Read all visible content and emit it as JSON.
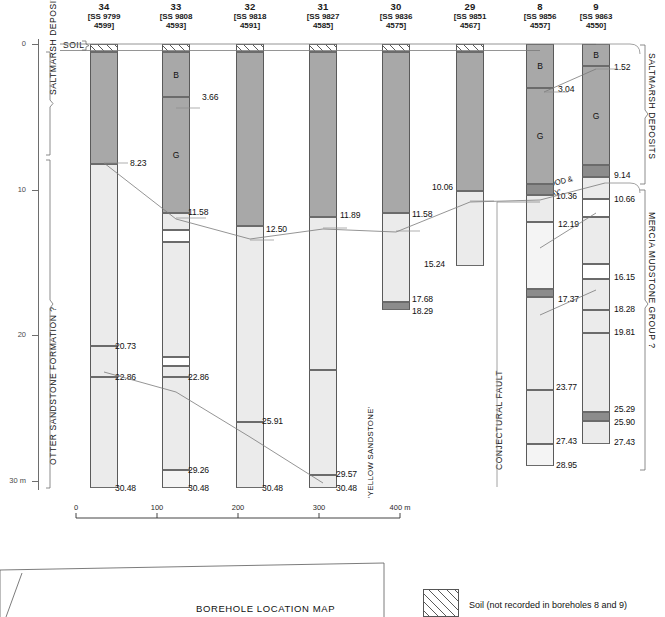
{
  "figure": {
    "soil_label": "SOIL",
    "left_group_labels": [
      "SALTMARSH DEPOSITS",
      "OTTER SANDSTONE FORMATION ?"
    ],
    "right_group_labels": [
      "SALTMARSH DEPOSITS",
      "MERCIA MUDSTONE GROUP ?"
    ],
    "fault_label": "CONJECTURAL FAULT",
    "depth_axis": {
      "ticks": [
        "0",
        "10",
        "20",
        "30 m"
      ],
      "values": [
        0,
        10,
        20,
        30
      ],
      "unit": "m"
    },
    "scale_bar": {
      "ticks": [
        "0",
        "100",
        "200",
        "300",
        "400 m"
      ],
      "values": [
        0,
        100,
        200,
        300,
        400
      ]
    },
    "legend": {
      "soil_swatch_label": "Soil (not recorded in boreholes 8 and 9)",
      "map_title": "BOREHOLE LOCATION MAP"
    },
    "inline_labels": {
      "red_marl_and_stone": "'RED MARL AND STONE'",
      "red_marl_and_stone_2line": "'RED MARL AND STONE'",
      "yellow_sandstone": "'YELLOW SANDSTONE'",
      "wood_and_clay": "'WOOD & CLAY'"
    }
  },
  "chart_data": {
    "type": "table",
    "ylabel": "Depth (m)",
    "ylim": [
      0,
      31
    ],
    "xlabel": "Distance (m)",
    "xlim": [
      0,
      400
    ],
    "boreholes": [
      {
        "id": "34",
        "grid_line1": "[SS 9799",
        "grid_line2": "4599]",
        "total_depth": "30.48",
        "depth_labels": [
          "8.23",
          "20.73",
          "22.86",
          "30.48"
        ],
        "layers": [
          {
            "top": 0.0,
            "base": 0.55,
            "fill": "soil",
            "label": ""
          },
          {
            "top": 0.55,
            "base": 8.23,
            "fill": "dark",
            "label": ""
          },
          {
            "top": 8.23,
            "base": 20.73,
            "fill": "light",
            "label": ""
          },
          {
            "top": 20.73,
            "base": 22.86,
            "fill": "light",
            "label": ""
          },
          {
            "top": 22.86,
            "base": 30.48,
            "fill": "light",
            "label": ""
          }
        ]
      },
      {
        "id": "33",
        "grid_line1": "[SS 9808",
        "grid_line2": "4593]",
        "total_depth": "30.48",
        "depth_labels": [
          "3.66",
          "11.58",
          "22.86",
          "30.48"
        ],
        "layers": [
          {
            "top": 0.0,
            "base": 0.55,
            "fill": "soil",
            "label": ""
          },
          {
            "top": 0.55,
            "base": 3.66,
            "fill": "dark",
            "label": "B"
          },
          {
            "top": 3.66,
            "base": 11.58,
            "fill": "dark",
            "label": "G"
          },
          {
            "top": 11.58,
            "base": 12.8,
            "fill": "light",
            "label": ""
          },
          {
            "top": 12.8,
            "base": 13.6,
            "fill": "white",
            "label": ""
          },
          {
            "top": 13.6,
            "base": 21.5,
            "fill": "light",
            "label": ""
          },
          {
            "top": 21.5,
            "base": 22.1,
            "fill": "white",
            "label": ""
          },
          {
            "top": 22.1,
            "base": 22.86,
            "fill": "light",
            "label": ""
          },
          {
            "top": 22.86,
            "base": 29.26,
            "fill": "light",
            "label": ""
          },
          {
            "top": 29.26,
            "base": 30.48,
            "fill": "lighter",
            "label": ""
          }
        ]
      },
      {
        "id": "32",
        "grid_line1": "[SS 9818",
        "grid_line2": "4591]",
        "total_depth": "30.48",
        "depth_labels": [
          "12.50",
          "25.91",
          "30.48"
        ],
        "layers": [
          {
            "top": 0.0,
            "base": 0.55,
            "fill": "soil",
            "label": ""
          },
          {
            "top": 0.55,
            "base": 12.5,
            "fill": "dark",
            "label": ""
          },
          {
            "top": 12.5,
            "base": 25.91,
            "fill": "light",
            "label": ""
          },
          {
            "top": 25.91,
            "base": 30.48,
            "fill": "light",
            "label": ""
          }
        ]
      },
      {
        "id": "31",
        "grid_line1": "[SS 9827",
        "grid_line2": "4585]",
        "total_depth": "30.48",
        "depth_labels": [
          "11.89",
          "29.57",
          "30.48"
        ],
        "layers": [
          {
            "top": 0.0,
            "base": 0.55,
            "fill": "soil",
            "label": ""
          },
          {
            "top": 0.55,
            "base": 11.89,
            "fill": "dark",
            "label": ""
          },
          {
            "top": 11.89,
            "base": 22.4,
            "fill": "light",
            "label": ""
          },
          {
            "top": 22.4,
            "base": 29.57,
            "fill": "light",
            "label": ""
          },
          {
            "top": 29.57,
            "base": 30.48,
            "fill": "light",
            "label": ""
          }
        ]
      },
      {
        "id": "30",
        "grid_line1": "[SS 9836",
        "grid_line2": "4575]",
        "total_depth": "18.29",
        "depth_labels": [
          "11.58",
          "17.68",
          "18.29"
        ],
        "layers": [
          {
            "top": 0.0,
            "base": 0.55,
            "fill": "soil",
            "label": ""
          },
          {
            "top": 0.55,
            "base": 11.58,
            "fill": "dark",
            "label": ""
          },
          {
            "top": 11.58,
            "base": 17.68,
            "fill": "light",
            "label": ""
          },
          {
            "top": 17.68,
            "base": 18.29,
            "fill": "darker",
            "label": ""
          }
        ]
      },
      {
        "id": "29",
        "grid_line1": "[SS 9851",
        "grid_line2": "4567]",
        "total_depth": "15.24",
        "depth_labels": [
          "10.06",
          "15.24"
        ],
        "layers": [
          {
            "top": 0.0,
            "base": 0.55,
            "fill": "soil",
            "label": ""
          },
          {
            "top": 0.55,
            "base": 10.06,
            "fill": "dark",
            "label": ""
          },
          {
            "top": 10.06,
            "base": 15.24,
            "fill": "light",
            "label": ""
          }
        ]
      },
      {
        "id": "8",
        "grid_line1": "[SS 9856",
        "grid_line2": "4557]",
        "total_depth": "28.95",
        "depth_labels": [
          "3.04",
          "10.36",
          "12.19",
          "17.37",
          "23.77",
          "27.43",
          "28.95"
        ],
        "layers": [
          {
            "top": 0.0,
            "base": 3.04,
            "fill": "dark",
            "label": "B"
          },
          {
            "top": 3.04,
            "base": 9.6,
            "fill": "dark",
            "label": "G"
          },
          {
            "top": 9.6,
            "base": 10.36,
            "fill": "darker",
            "label": ""
          },
          {
            "top": 10.36,
            "base": 12.19,
            "fill": "light",
            "label": ""
          },
          {
            "top": 12.19,
            "base": 16.8,
            "fill": "lighter",
            "label": ""
          },
          {
            "top": 16.8,
            "base": 17.37,
            "fill": "darker",
            "label": ""
          },
          {
            "top": 17.37,
            "base": 23.77,
            "fill": "light",
            "label": ""
          },
          {
            "top": 23.77,
            "base": 27.43,
            "fill": "light",
            "label": ""
          },
          {
            "top": 27.43,
            "base": 28.95,
            "fill": "lighter",
            "label": ""
          }
        ]
      },
      {
        "id": "9",
        "grid_line1": "[SS 9863",
        "grid_line2": "4550]",
        "total_depth": "27.43",
        "depth_labels": [
          "1.52",
          "9.14",
          "10.66",
          "16.15",
          "18.28",
          "19.81",
          "25.29",
          "25.90",
          "27.43"
        ],
        "layers": [
          {
            "top": 0.0,
            "base": 1.52,
            "fill": "dark",
            "label": "B"
          },
          {
            "top": 1.52,
            "base": 8.3,
            "fill": "dark",
            "label": "G"
          },
          {
            "top": 8.3,
            "base": 9.14,
            "fill": "darker",
            "label": ""
          },
          {
            "top": 9.14,
            "base": 10.66,
            "fill": "light",
            "label": ""
          },
          {
            "top": 10.66,
            "base": 11.9,
            "fill": "white",
            "label": ""
          },
          {
            "top": 11.9,
            "base": 15.1,
            "fill": "light",
            "label": ""
          },
          {
            "top": 15.1,
            "base": 16.15,
            "fill": "white",
            "label": ""
          },
          {
            "top": 16.15,
            "base": 18.28,
            "fill": "light",
            "label": ""
          },
          {
            "top": 18.28,
            "base": 19.81,
            "fill": "light",
            "label": ""
          },
          {
            "top": 19.81,
            "base": 25.29,
            "fill": "light",
            "label": ""
          },
          {
            "top": 25.29,
            "base": 25.9,
            "fill": "darker",
            "label": ""
          },
          {
            "top": 25.9,
            "base": 27.43,
            "fill": "light",
            "label": ""
          }
        ]
      }
    ]
  }
}
